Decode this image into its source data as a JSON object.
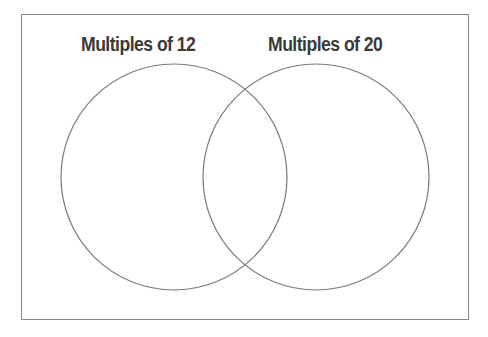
{
  "diagram": {
    "type": "venn",
    "sets": [
      {
        "label": "Multiples of 12",
        "cx": 174,
        "cy": 177,
        "r": 113
      },
      {
        "label": "Multiples of 20",
        "cx": 316,
        "cy": 177,
        "r": 113
      }
    ],
    "colors": {
      "stroke": "#7a7a7a",
      "text": "#3a3a3a",
      "border": "#8a8a8a"
    }
  }
}
